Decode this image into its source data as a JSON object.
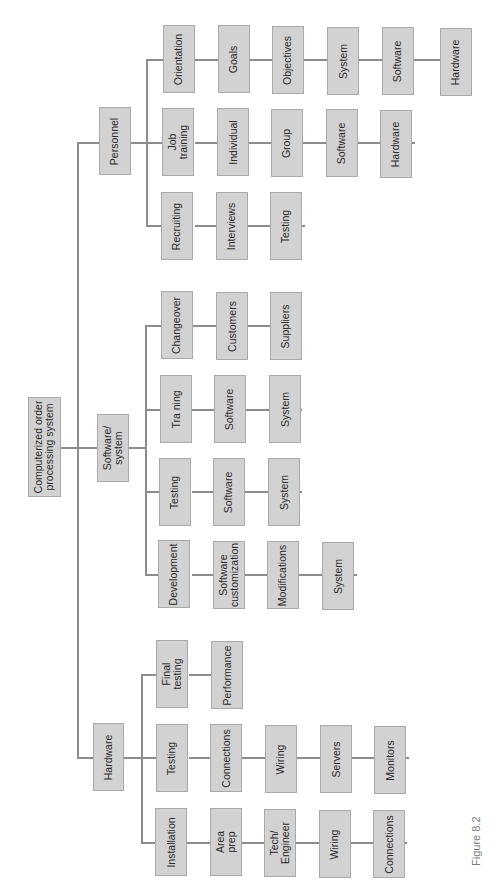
{
  "diagram": {
    "type": "work-breakdown-structure",
    "orientation": "rotated-90-ccw",
    "colors": {
      "box_fill": "#d2d2d2",
      "box_border": "#a9a9a9",
      "line": "#8c8c8c",
      "text": "#2a2a2a",
      "caption": "#7a7a7a"
    },
    "root": {
      "label": "Computerized order\nprocessing system"
    },
    "branches": [
      {
        "label": "Personnel",
        "children": [
          {
            "label": "Orientation",
            "chain": [
              "Goals",
              "Objectives",
              "System",
              "Software",
              "Hardware"
            ]
          },
          {
            "label": "Job\ntraining",
            "chain": [
              "Individual",
              "Group",
              "Software",
              "Hardware"
            ]
          },
          {
            "label": "Recruiting",
            "chain": [
              "Interviews",
              "Testing"
            ]
          }
        ]
      },
      {
        "label": "Software/\nsystem",
        "children": [
          {
            "label": "Changeover",
            "chain": [
              "Customers",
              "Suppliers"
            ]
          },
          {
            "label": "Tra ning",
            "chain": [
              "Software",
              "System"
            ]
          },
          {
            "label": "Testing",
            "chain": [
              "Software",
              "System"
            ]
          },
          {
            "label": "Development",
            "chain": [
              "Software\ncustomization",
              "Modifications",
              "System"
            ]
          }
        ]
      },
      {
        "label": "Hardware",
        "children": [
          {
            "label": "Final\ntesting",
            "chain": [
              "Performance"
            ]
          },
          {
            "label": "Testing",
            "chain": [
              "Connections",
              "Wiring",
              "Servers",
              "Monitors"
            ]
          },
          {
            "label": "Installation",
            "chain": [
              "Area\nprep",
              "Tech/\nEngineer",
              "Wiring",
              "Connections"
            ]
          }
        ]
      }
    ],
    "caption": "Figure 8.2"
  }
}
